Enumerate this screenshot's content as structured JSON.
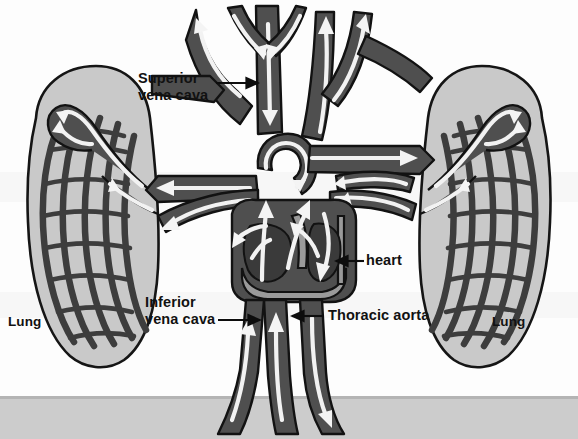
{
  "figure": {
    "type": "anatomical-diagram",
    "background_color": "#fdfdfd",
    "page_edge_color": "#cfcfcf"
  },
  "palette": {
    "vessel_fill": "#4f4f4f",
    "vessel_outline": "#121212",
    "lung_fill": "#c9c9c9",
    "lung_outline": "#151515",
    "capillary_fill": "#3d3d3d",
    "heart_fill": "#4a4a4a",
    "heart_wall": "#9a9a9a",
    "flow_arrow": "#f4f4f4",
    "label_color": "#111111"
  },
  "labels": {
    "superior_vena_cava": "Superior\nvena cava",
    "inferior_vena_cava": "Inferior\nvena cava",
    "thoracic_aorta": "Thoracic aorta",
    "heart": "heart",
    "lung_left": "Lung",
    "lung_right": "Lung"
  },
  "leader_lines": {
    "superior_vena_cava": {
      "direction": "right",
      "from": [
        218,
        83
      ],
      "to": [
        262,
        83
      ]
    },
    "inferior_vena_cava": {
      "direction": "right",
      "from": [
        218,
        320
      ],
      "to": [
        262,
        320
      ]
    },
    "thoracic_aorta": {
      "direction": "left",
      "from": [
        322,
        316
      ],
      "to": [
        288,
        316
      ]
    },
    "heart": {
      "direction": "left",
      "from": [
        364,
        261
      ],
      "to": [
        333,
        261
      ]
    }
  },
  "structures": [
    {
      "name": "left-lung",
      "label": "Lung",
      "side": "left"
    },
    {
      "name": "right-lung",
      "label": "Lung",
      "side": "right"
    },
    {
      "name": "heart",
      "label": "heart",
      "side": "center"
    },
    {
      "name": "superior-vena-cava",
      "label": "Superior vena cava",
      "flow": "toward heart"
    },
    {
      "name": "inferior-vena-cava",
      "label": "Inferior vena cava",
      "flow": "toward heart"
    },
    {
      "name": "thoracic-aorta",
      "label": "Thoracic aorta",
      "flow": "away from heart"
    },
    {
      "name": "aortic-arch",
      "label": "aortic arch",
      "flow": "away from heart"
    },
    {
      "name": "pulmonary-arteries",
      "label": "pulmonary arteries",
      "flow": "heart to lungs"
    },
    {
      "name": "pulmonary-veins",
      "label": "pulmonary veins",
      "flow": "lungs to heart"
    },
    {
      "name": "lung-capillary-bed",
      "label": "capillary network",
      "flow": "gas exchange"
    }
  ]
}
